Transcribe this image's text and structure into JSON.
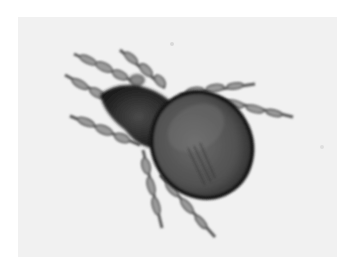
{
  "image": {
    "subject": "mite",
    "style": "grayscale micrograph",
    "background_color": "#f1f1f1",
    "margin_color": "#ffffff",
    "body_color": "#4a4a4a",
    "outline_color": "#151515",
    "leg_color": "#7a7a7a",
    "legs": 8
  }
}
